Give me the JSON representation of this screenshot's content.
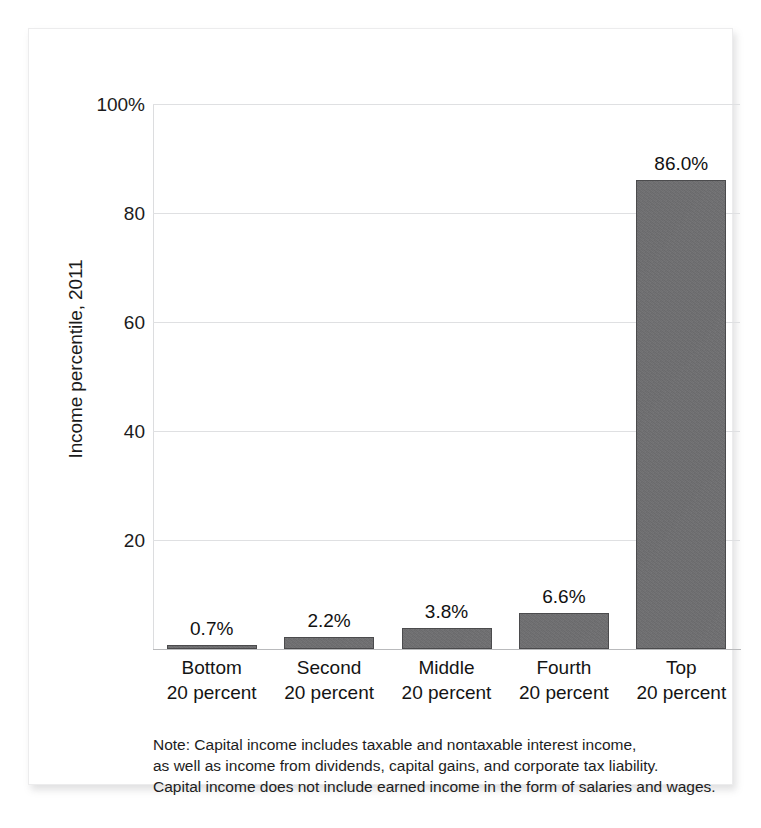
{
  "chart_data": {
    "type": "bar",
    "title": "",
    "subtitle": "",
    "xlabel": "",
    "ylabel": "Income percentile, 2011",
    "ylim": [
      0,
      100
    ],
    "grid": true,
    "legend": "none",
    "orientation": "vertical",
    "bar_color": "#6e6e70",
    "categories": [
      "Bottom 20 percent",
      "Second 20 percent",
      "Middle 20 percent",
      "Fourth 20 percent",
      "Top 20 percent"
    ],
    "category_lines": [
      {
        "line1": "Bottom",
        "line2": "20 percent"
      },
      {
        "line1": "Second",
        "line2": "20 percent"
      },
      {
        "line1": "Middle",
        "line2": "20 percent"
      },
      {
        "line1": "Fourth",
        "line2": "20 percent"
      },
      {
        "line1": "Top",
        "line2": "20 percent"
      }
    ],
    "values": [
      0.7,
      2.2,
      3.8,
      6.6,
      86.0
    ],
    "value_labels": [
      "0.7%",
      "2.2%",
      "3.8%",
      "6.6%",
      "86.0%"
    ],
    "yticks": [
      100,
      80,
      60,
      40,
      20
    ],
    "ytick_labels": [
      "100%",
      "80",
      "60",
      "40",
      "20"
    ]
  },
  "note": {
    "line1": "Note: Capital income includes taxable and nontaxable interest income,",
    "line2": "as well as income from dividends, capital gains, and corporate tax liability.",
    "line3": "Capital income does not include earned income in the form of salaries and wages."
  }
}
